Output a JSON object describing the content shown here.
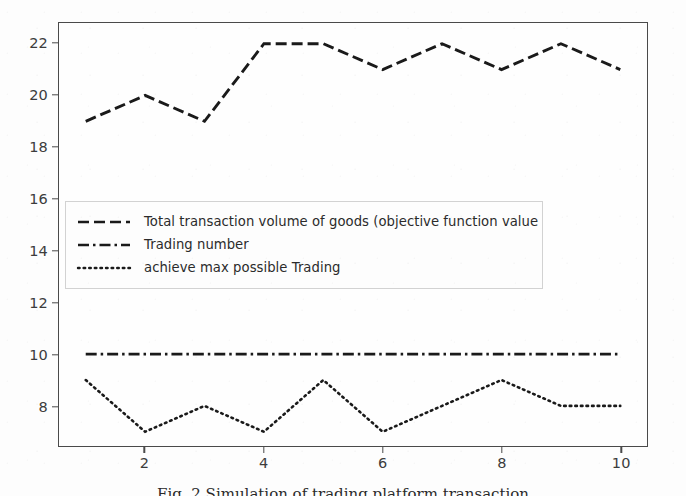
{
  "chart_data": {
    "type": "line",
    "title": "",
    "xlabel": "",
    "ylabel": "",
    "x": [
      1,
      2,
      3,
      4,
      5,
      6,
      7,
      8,
      9,
      10
    ],
    "xlim": [
      0.55,
      10.45
    ],
    "ylim": [
      6.45,
      22.8
    ],
    "xticks": [
      "2",
      "4",
      "6",
      "8",
      "10"
    ],
    "xtick_values": [
      2,
      4,
      6,
      8,
      10
    ],
    "yticks": [
      "8",
      "10",
      "12",
      "14",
      "16",
      "18",
      "20",
      "22"
    ],
    "ytick_values": [
      8,
      10,
      12,
      14,
      16,
      18,
      20,
      22
    ],
    "grid": false,
    "legend_position": "upper-left",
    "line_color": "#1a1a1a",
    "series": [
      {
        "name": "Total transaction volume of goods (objective function value",
        "style": "dashed",
        "values": [
          19,
          20,
          19,
          22,
          22,
          21,
          22,
          21,
          22,
          21
        ]
      },
      {
        "name": "Trading number",
        "style": "dashdot",
        "values": [
          10,
          10,
          10,
          10,
          10,
          10,
          10,
          10,
          10,
          10
        ]
      },
      {
        "name": "achieve max possible Trading",
        "style": "dotted",
        "values": [
          9,
          7,
          8,
          7,
          9,
          7,
          8,
          9,
          8,
          8
        ]
      }
    ]
  },
  "legend": {
    "items": [
      {
        "label": "Total transaction volume of goods (objective function value",
        "style": "dashed"
      },
      {
        "label": "Trading number",
        "style": "dashdot"
      },
      {
        "label": "achieve max possible Trading",
        "style": "dotted"
      }
    ]
  },
  "caption": {
    "text": "Fig. 2  Simulation of trading platform transaction"
  }
}
